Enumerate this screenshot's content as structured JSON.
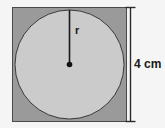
{
  "figure": {
    "background_color": "#f5f5f5",
    "square": {
      "fill_color": "#9a9a9a",
      "stroke_color": "#4a4a4a",
      "x": 12,
      "y": 7,
      "width": 115,
      "height": 115
    },
    "circle": {
      "fill_color": "#cbcbcb",
      "stroke_color": "#3a3a3a",
      "center_x": 69.5,
      "center_y": 64.5,
      "radius": 55
    },
    "radius_line": {
      "label": "r",
      "stroke_color": "#1a1a1a",
      "from_x": 69.5,
      "from_y": 9.5,
      "to_x": 69.5,
      "to_y": 64.5
    },
    "center_dot": {
      "color": "#111111",
      "x": 69.5,
      "y": 64.5,
      "radius": 3
    },
    "dimension": {
      "label": "4 cm",
      "value": 4,
      "unit": "cm",
      "stroke_color": "#2a2a2a",
      "line_x": 130,
      "top_y": 7,
      "bottom_y": 122,
      "cap_half_width": 5
    }
  }
}
